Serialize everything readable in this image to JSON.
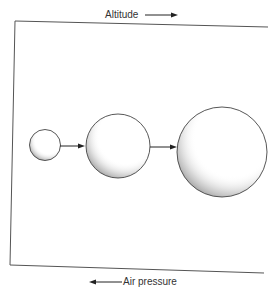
{
  "labels": {
    "top": "Altitude",
    "bottom": "Air pressure"
  },
  "arrows": {
    "top_direction": "right",
    "bottom_direction": "left"
  },
  "balloons": [
    {
      "name": "small",
      "relative_size": 1
    },
    {
      "name": "medium",
      "relative_size": 2.1
    },
    {
      "name": "large",
      "relative_size": 3
    }
  ],
  "colors": {
    "line": "#444444",
    "text": "#333333",
    "stipple": "#555555"
  }
}
